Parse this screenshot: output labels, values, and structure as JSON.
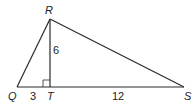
{
  "diagram": {
    "type": "geometry-triangle",
    "vertices": {
      "Q": {
        "label": "Q",
        "x": 17,
        "y": 87
      },
      "R": {
        "label": "R",
        "x": 50,
        "y": 19
      },
      "S": {
        "label": "S",
        "x": 184,
        "y": 87
      },
      "T": {
        "label": "T",
        "x": 50,
        "y": 87
      }
    },
    "segments": [
      {
        "from": "Q",
        "to": "R"
      },
      {
        "from": "R",
        "to": "S"
      },
      {
        "from": "Q",
        "to": "S"
      },
      {
        "from": "R",
        "to": "T"
      }
    ],
    "measures": {
      "RT": "6",
      "QT": "3",
      "TS": "12"
    },
    "right_angle_at": "T",
    "colors": {
      "stroke": "#2a2a2a",
      "background": "#ffffff"
    }
  }
}
